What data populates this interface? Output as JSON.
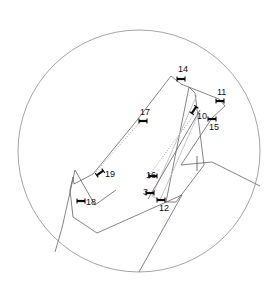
{
  "view": {
    "title": "Circular field-of-view annotated segment diagram",
    "width": 279,
    "height": 292,
    "background_color": "#ffffff"
  },
  "fov": {
    "name": "field-of-view-circle",
    "cx": 139,
    "cy": 151,
    "r": 121,
    "stroke_color": "#9a9a9a"
  },
  "colors": {
    "line": "#6e6e6e",
    "line_faint": "#b4b4b4",
    "marker": "#0a0a0a",
    "circle": "#9a9a9a",
    "text": "#111111"
  },
  "markers": [
    {
      "id": "14",
      "label": "14",
      "x": 181,
      "y": 79,
      "label_x": 178,
      "label_y": 70,
      "angle": 0
    },
    {
      "id": "11",
      "label": "11",
      "x": 220,
      "y": 101,
      "label_x": 217,
      "label_y": 93,
      "angle": 0
    },
    {
      "id": "10",
      "label": "10",
      "x": 194,
      "y": 110,
      "label_x": 197,
      "label_y": 117,
      "angle": -55
    },
    {
      "id": "15",
      "label": "15",
      "x": 212,
      "y": 119,
      "label_x": 209,
      "label_y": 128,
      "angle": 0
    },
    {
      "id": "17",
      "label": "17",
      "x": 143,
      "y": 121,
      "label_x": 140,
      "label_y": 113,
      "angle": 0
    },
    {
      "id": "19",
      "label": "19",
      "x": 100,
      "y": 173,
      "label_x": 105,
      "label_y": 175,
      "angle": -35
    },
    {
      "id": "16",
      "label": "16",
      "x": 153,
      "y": 176,
      "label_x": 146,
      "label_y": 176,
      "angle": 0
    },
    {
      "id": "3",
      "label": "3",
      "x": 150,
      "y": 193,
      "label_x": 143,
      "label_y": 193,
      "angle": 0
    },
    {
      "id": "18",
      "label": "18",
      "x": 81,
      "y": 201,
      "label_x": 86,
      "label_y": 203,
      "angle": 0
    },
    {
      "id": "12",
      "label": "12",
      "x": 161,
      "y": 200,
      "label_x": 159,
      "label_y": 209,
      "angle": 0
    }
  ],
  "unlabeled_tick": {
    "name": "plain-tick-mark",
    "x": 197,
    "y": 163,
    "length": 15
  },
  "paths": {
    "outer_left_polygon": "M 171,76 L 134,124 L 93,174 L 74,184 L 73,177 L 70,190 L 73,217 L 97,233 L 182,195",
    "inner_left_spur": "M 171,76 L 181,84 L 200,110",
    "upper_right_quad": "M 181,84 L 219,99 L 225,106 L 212,118",
    "inner_wedge": "M 189,87 L 166,202 L 176,202 L 204,165 L 195,93 L 189,87",
    "narrow_sliver": "M 197,95 L 152,196 L 160,200 L 200,110 L 197,95",
    "long_spine": "M 200,110 L 148,199",
    "lower_left_v": "M 62,228 L 75,170 L 95,205 L 116,190",
    "lower_right_quad": "M 181,165 L 212,162 L 260,186",
    "bottom_tail": "M 139,272 L 182,195",
    "right_lower_edge": "M 212,118 L 181,165",
    "faint_dotted_trace": "M 93,174 L 143,121 L 171,79"
  },
  "polylines": [
    {
      "name": "outer-boundary-upper-left",
      "points": "171,76 134,124 93,174 74,184"
    },
    {
      "name": "outer-boundary-lower-left",
      "points": "74,184 73,177 70,190 73,217 97,233 182,195"
    },
    {
      "name": "ridge-v-shape",
      "points": "62,228 75,170 95,205 116,190"
    },
    {
      "name": "cap-segment-top",
      "points": "171,76 181,84 219,99"
    },
    {
      "name": "right-panel",
      "points": "219,99 225,106 212,118 181,165"
    },
    {
      "name": "inner-wedge-left",
      "points": "189,87 166,202"
    },
    {
      "name": "inner-wedge-right",
      "points": "195,93 204,165 176,202 166,202"
    },
    {
      "name": "sliver-left",
      "points": "197,95 152,196"
    },
    {
      "name": "sliver-right",
      "points": "200,110 160,200 152,196"
    },
    {
      "name": "spine-line",
      "points": "200,110 148,199"
    },
    {
      "name": "lower-right-arm",
      "points": "181,165 212,162 260,186"
    },
    {
      "name": "bottom-descender",
      "points": "182,195 139,272"
    },
    {
      "name": "left-descender",
      "points": "62,228 55,252"
    }
  ],
  "dotted_traces": [
    {
      "name": "faint-dotted-upper",
      "points": "96,172 140,122"
    },
    {
      "name": "faint-dotted-lower",
      "points": "147,178 196,112"
    }
  ]
}
